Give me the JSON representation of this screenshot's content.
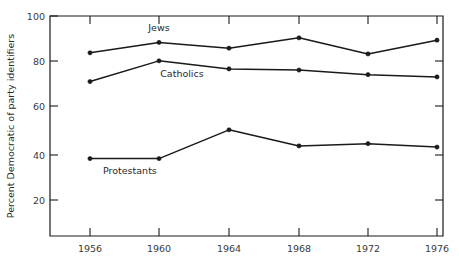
{
  "chart_data": {
    "type": "line",
    "title": "",
    "xlabel": "",
    "ylabel": "Percent Democratic of party identifiers",
    "categories": [
      "1956",
      "1960",
      "1964",
      "1968",
      "1972",
      "1976"
    ],
    "x": [
      1956,
      1960,
      1964,
      1968,
      1972,
      1976
    ],
    "xlim": [
      1954,
      1978
    ],
    "ylim": [
      0,
      100
    ],
    "yticks": [
      20,
      40,
      60,
      80,
      100
    ],
    "ytick_labels": [
      "20",
      "40",
      "60",
      "80",
      "100"
    ],
    "xtick_labels": [
      "1956",
      "1960",
      "1964",
      "1968",
      "1972",
      "1976"
    ],
    "grid": false,
    "legend": "inline-labels",
    "series": [
      {
        "name": "Jews",
        "label": "Jews",
        "values": [
          84,
          88.5,
          86,
          90.5,
          83.5,
          89.5
        ]
      },
      {
        "name": "Catholics",
        "label": "Catholics",
        "values": [
          71.5,
          80.5,
          77,
          76.5,
          74.5,
          73.5
        ]
      },
      {
        "name": "Protestants",
        "label": "Protestants",
        "values": [
          38,
          38,
          50.5,
          43.5,
          44.5,
          43
        ]
      }
    ],
    "annotations": [
      {
        "text": "Jews",
        "x": 1960.0,
        "y": 93.5
      },
      {
        "text": "Catholics",
        "x": 1961.3,
        "y": 73.5
      },
      {
        "text": "Protestants",
        "x": 1958.3,
        "y": 31.5
      }
    ]
  }
}
